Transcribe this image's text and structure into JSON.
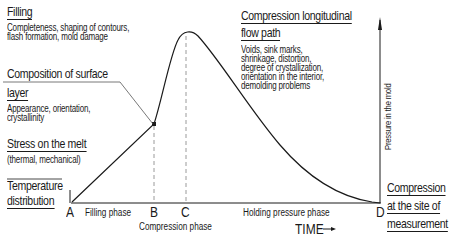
{
  "diagram": {
    "type": "cavity-pressure-profile",
    "y_axis_label": "Pressure in the mold",
    "x_axis_label": "TIME",
    "points": [
      "A",
      "B",
      "C",
      "D"
    ],
    "phases": [
      {
        "label": "Filling phase",
        "from": "A",
        "to": "B"
      },
      {
        "label": "Compression phase",
        "from": "B",
        "to": "C"
      },
      {
        "label": "Holding pressure phase",
        "from": "C",
        "to": "D"
      }
    ]
  },
  "annotations": {
    "filling": {
      "title": "Filling",
      "detail_line1": "Completeness, shaping of contours,",
      "detail_line2": "flash formation, mold damage"
    },
    "surface_layer": {
      "title_line1": "Composition of surface",
      "title_line2": "layer",
      "detail_line1": "Appearance, orientation,",
      "detail_line2": "crystallinity"
    },
    "stress": {
      "title": "Stress on the melt",
      "detail": "(thermal, mechanical)"
    },
    "temperature": {
      "title_line1": "Temperature",
      "title_line2": "distribution"
    },
    "compression_flow": {
      "title_line1": "Compression longitudinal",
      "title_line2": "flow path",
      "detail_line1": "Voids, sink marks,",
      "detail_line2": "shrinkage, distortion,",
      "detail_line3": "degree of crystallization,",
      "detail_line4": "orientation in the interior,",
      "detail_line5": "demolding problems"
    },
    "compression_site": {
      "title_line1": "Compression",
      "title_line2": "at the site of",
      "title_line3": "measurement"
    }
  },
  "colors": {
    "line": "#1a1a1a",
    "dashed": "#9a9a9a",
    "background": "#ffffff"
  }
}
